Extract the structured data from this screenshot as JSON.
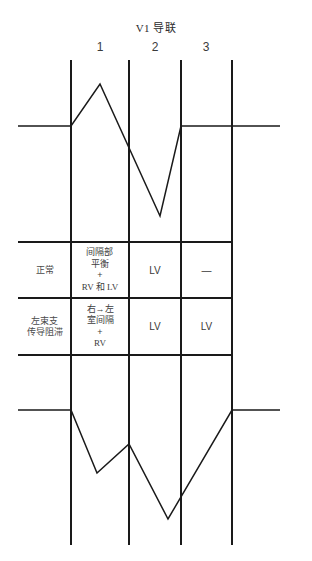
{
  "title": "V1 导联",
  "columns": [
    {
      "label": "1"
    },
    {
      "label": "2"
    },
    {
      "label": "3"
    }
  ],
  "table": {
    "rows": [
      {
        "condition": "正常",
        "mechanism_lines": [
          "间隔部",
          "平衡",
          "+",
          "RV 和 LV"
        ],
        "col2": "LV",
        "col3": "—"
      },
      {
        "condition_lines": [
          "左束支",
          "传导阻滞"
        ],
        "mechanism_lines": [
          "右→左",
          "室间隔",
          "+",
          "RV"
        ],
        "col2": "LV",
        "col3": "LV"
      }
    ]
  },
  "waveforms": {
    "top": {
      "name": "normal-v1-complex",
      "baseline_y": 126,
      "points": "18,126 71,126 100,84 160,216 181,126 280,126"
    },
    "bottom": {
      "name": "lbbb-v1-complex",
      "baseline_y": 410,
      "points": "18,410 71,410 97,473 129,444 168,519 232,410 280,410"
    }
  },
  "grid": {
    "vertical_lines_x": [
      71,
      129,
      181,
      232
    ],
    "vertical_top_y": 60,
    "vertical_bottom_y": 545,
    "table_left_x": 18,
    "table_right_x": 232,
    "table_top_y": 242,
    "table_mid_y": 298,
    "table_bottom_y": 355,
    "col_divider_x": [
      71,
      129,
      181
    ]
  },
  "colors": {
    "line": "#1a1a1a",
    "text": "#3a3a3a",
    "background": "#ffffff"
  }
}
